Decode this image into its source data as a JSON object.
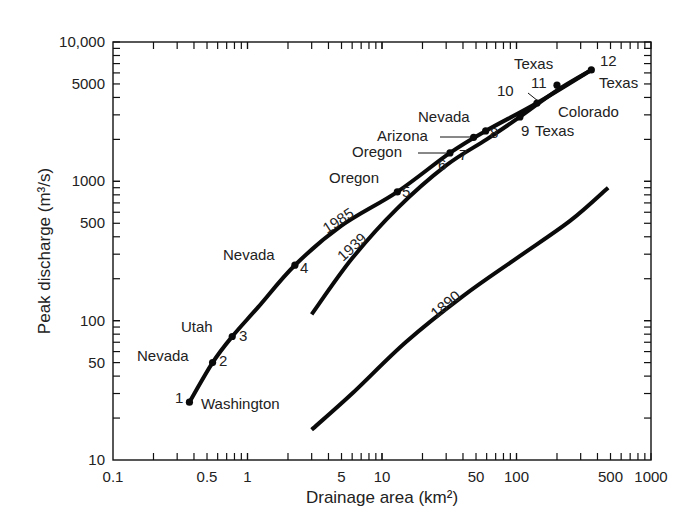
{
  "chart_data": {
    "type": "line",
    "title": "",
    "xlabel": "Drainage area (km²)",
    "ylabel": "Peak discharge (m³/s)",
    "xscale": "log",
    "yscale": "log",
    "xlim": [
      0.1,
      1000
    ],
    "ylim": [
      10,
      10000
    ],
    "x_ticks": [
      {
        "v": 0.1,
        "label": "0.1"
      },
      {
        "v": 0.5,
        "label": "0.5"
      },
      {
        "v": 1,
        "label": "1"
      },
      {
        "v": 5,
        "label": "5"
      },
      {
        "v": 10,
        "label": "10"
      },
      {
        "v": 50,
        "label": "50"
      },
      {
        "v": 100,
        "label": "100"
      },
      {
        "v": 500,
        "label": "500"
      },
      {
        "v": 1000,
        "label": "1000"
      }
    ],
    "y_ticks": [
      {
        "v": 10,
        "label": "10"
      },
      {
        "v": 50,
        "label": "50"
      },
      {
        "v": 100,
        "label": "100"
      },
      {
        "v": 500,
        "label": "500"
      },
      {
        "v": 1000,
        "label": "1000"
      },
      {
        "v": 5000,
        "label": "5000"
      },
      {
        "v": 10000,
        "label": "10,000"
      }
    ],
    "grid": false,
    "legend": "none (curves labeled inline)",
    "series": [
      {
        "name": "1985",
        "points": [
          [
            0.37,
            26
          ],
          [
            0.55,
            50
          ],
          [
            0.77,
            77
          ],
          [
            1.2,
            125
          ],
          [
            2.25,
            250
          ],
          [
            5,
            480
          ],
          [
            13,
            840
          ],
          [
            32,
            1600
          ],
          [
            59,
            2300
          ],
          [
            142,
            3650
          ],
          [
            360,
            6300
          ]
        ]
      },
      {
        "name": "1939",
        "points": [
          [
            3.0,
            111
          ],
          [
            6,
            280
          ],
          [
            13,
            640
          ],
          [
            30,
            1300
          ],
          [
            60,
            2000
          ],
          [
            106,
            2900
          ],
          [
            200,
            4500
          ],
          [
            360,
            6300
          ]
        ]
      },
      {
        "name": "1890",
        "points": [
          [
            3.0,
            16.5
          ],
          [
            6,
            30
          ],
          [
            15,
            70
          ],
          [
            40,
            150
          ],
          [
            100,
            280
          ],
          [
            250,
            520
          ],
          [
            480,
            900
          ]
        ]
      }
    ],
    "annotations": [
      {
        "id": "1",
        "place": "Washington",
        "x": 0.37,
        "y": 26
      },
      {
        "id": "2",
        "place": "Nevada",
        "x": 0.55,
        "y": 50
      },
      {
        "id": "3",
        "place": "Utah",
        "x": 0.77,
        "y": 77
      },
      {
        "id": "4",
        "place": "Nevada",
        "x": 2.25,
        "y": 250
      },
      {
        "id": "5",
        "place": "Oregon",
        "x": 13,
        "y": 840
      },
      {
        "id": "6",
        "place": "Oregon",
        "x": 32,
        "y": 1600
      },
      {
        "id": "7",
        "place": "Arizona",
        "x": 48,
        "y": 2070
      },
      {
        "id": "8",
        "place": "Nevada",
        "x": 59,
        "y": 2300
      },
      {
        "id": "9",
        "place": "Texas",
        "x": 106,
        "y": 2900
      },
      {
        "id": "10",
        "place": "Colorado",
        "x": 142,
        "y": 3650
      },
      {
        "id": "11",
        "place": "Texas",
        "x": 200,
        "y": 4900
      },
      {
        "id": "12",
        "place": "Texas",
        "x": 360,
        "y": 6300
      }
    ]
  }
}
